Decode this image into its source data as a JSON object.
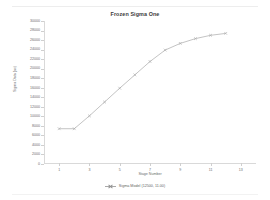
{
  "chart_data": {
    "type": "line",
    "title": "Frozen Sigma One",
    "xlabel": "Stage Number",
    "ylabel": "Sigma Data (ac)",
    "x": [
      1,
      2,
      3,
      4,
      5,
      6,
      7,
      8,
      9,
      10,
      11,
      12
    ],
    "xlim": [
      0,
      14
    ],
    "ylim": [
      0,
      30000
    ],
    "xticks": [
      1,
      3,
      5,
      7,
      9,
      11,
      13
    ],
    "xtick_labels": [
      "1",
      "3",
      "5",
      "7",
      "9",
      "11",
      "13"
    ],
    "yticks": [
      0,
      2000,
      4000,
      6000,
      8000,
      10000,
      12000,
      14000,
      16000,
      18000,
      20000,
      22000,
      24000,
      26000,
      28000,
      30000
    ],
    "ytick_labels": [
      "0",
      "2000",
      "4000",
      "6000",
      "8000",
      "10000",
      "12000",
      "14000",
      "16000",
      "18000",
      "20000",
      "22000",
      "24000",
      "26000",
      "28000",
      "30000"
    ],
    "grid": false,
    "legend_position": "bottom",
    "series": [
      {
        "name": "Sigma Model (12500, 11.00)",
        "color": "#a9a9a9",
        "marker": "x",
        "values": [
          7400,
          7400,
          10100,
          13000,
          15900,
          18700,
          21500,
          23900,
          25300,
          26300,
          27000,
          27400
        ]
      }
    ]
  },
  "legend": {
    "entries": [
      {
        "label": "Sigma Model (12500, 11.00)"
      }
    ]
  }
}
